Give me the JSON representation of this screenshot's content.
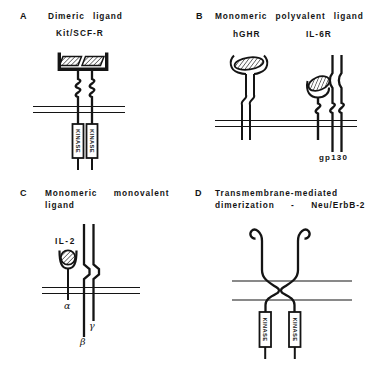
{
  "figure": {
    "background": "#ffffff",
    "ink": "#141414"
  },
  "panels": {
    "a": {
      "letter": "A",
      "title": "Dimeric ligand",
      "subtitle": "Kit/SCF-R",
      "kinase_label": "KINASE"
    },
    "b": {
      "letter": "B",
      "title": "Monomeric polyvalent ligand",
      "receptor_left_label": "hGHR",
      "receptor_right_label": "IL-6R",
      "gp130_label": "gp130"
    },
    "c": {
      "letter": "C",
      "title_line1": "Monomeric  monovalent",
      "title_line2": "ligand",
      "ligand_label": "IL-2",
      "alpha_label": "α",
      "beta_label": "β",
      "gamma_label": "γ"
    },
    "d": {
      "letter": "D",
      "title_line1": "Transmembrane-mediated",
      "title_line2": "dimerization  -  Neu/ErbB-2",
      "kinase_label": "KINASE"
    }
  }
}
